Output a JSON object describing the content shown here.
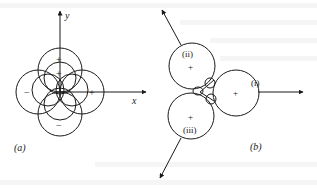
{
  "figure": {
    "panel_a": {
      "label": "(a)",
      "x_axis_label": "x",
      "y_axis_label": "y",
      "lobes": [
        {
          "position": "top",
          "sign": "+"
        },
        {
          "position": "inner-top",
          "sign": "+"
        },
        {
          "position": "right",
          "sign": "+"
        },
        {
          "position": "left",
          "sign": "−"
        },
        {
          "position": "bottom",
          "sign": "−"
        }
      ]
    },
    "panel_b": {
      "label": "(b)",
      "lobes": [
        {
          "id": "i",
          "label": "(i)",
          "sign": "+"
        },
        {
          "id": "ii",
          "label": "(ii)",
          "sign": "+"
        },
        {
          "id": "iii",
          "label": "(iii)",
          "sign": "+"
        }
      ]
    },
    "colors": {
      "line": "#1a1a1a",
      "background": "#ffffff"
    }
  }
}
